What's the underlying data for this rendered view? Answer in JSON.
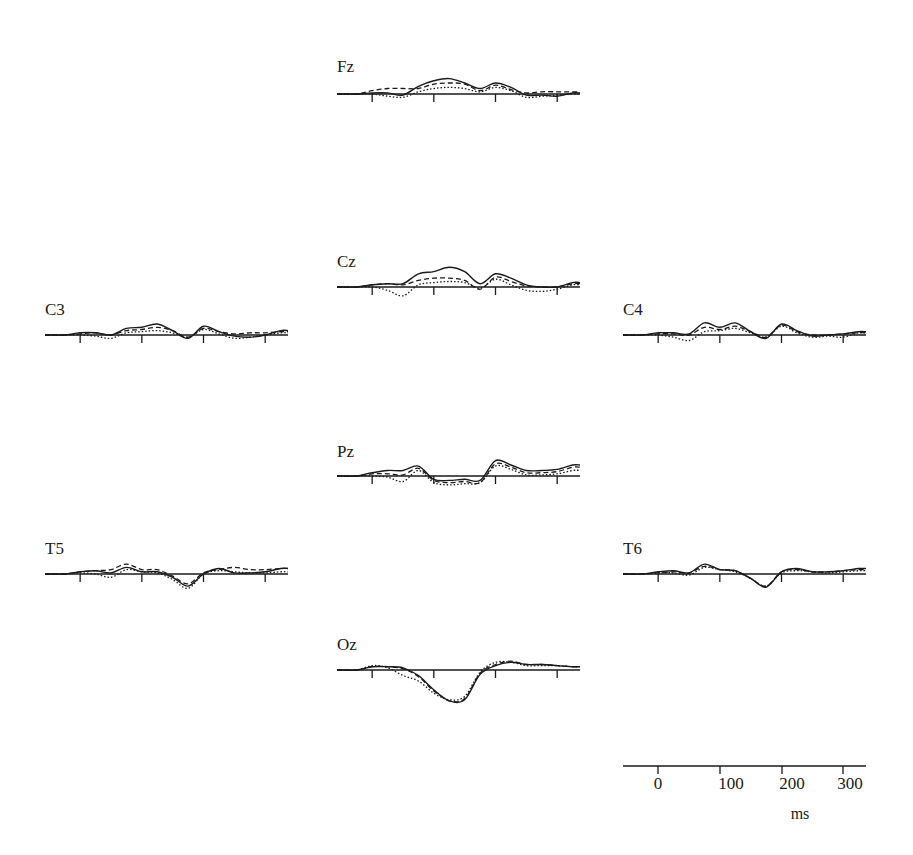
{
  "chart_data": {
    "type": "line",
    "title": "",
    "xlabel": "ms",
    "ylabel": "",
    "xlim": [
      -57,
      337
    ],
    "x_ticks": [
      0,
      100,
      200,
      300
    ],
    "x_tick_labels": [
      "0",
      "100",
      "200",
      "300"
    ],
    "grid": false,
    "legend": null,
    "line_styles": {
      "solid": "condition 1",
      "dashed": "condition 2",
      "dotted": "condition 3"
    },
    "x": [
      -50,
      -25,
      0,
      25,
      50,
      75,
      100,
      125,
      150,
      175,
      200,
      225,
      250,
      275,
      300,
      325
    ],
    "y_units": "relative amplitude (unlabeled)",
    "panels": [
      {
        "electrode": "Fz",
        "series": [
          {
            "name": "solid",
            "values": [
              0,
              0,
              1,
              1,
              -1,
              7,
              12,
              14,
              10,
              5,
              10,
              6,
              -1,
              -1,
              -2,
              1
            ]
          },
          {
            "name": "dashed",
            "values": [
              0,
              0,
              3,
              5,
              5,
              5,
              9,
              10,
              9,
              3,
              8,
              4,
              1,
              2,
              2,
              2
            ]
          },
          {
            "name": "dotted",
            "values": [
              0,
              0,
              0,
              -2,
              -3,
              2,
              5,
              6,
              5,
              2,
              6,
              3,
              -3,
              -2,
              -1,
              0
            ]
          }
        ]
      },
      {
        "electrode": "Cz",
        "series": [
          {
            "name": "solid",
            "values": [
              0,
              0,
              2,
              3,
              3,
              12,
              14,
              18,
              14,
              3,
              12,
              8,
              2,
              0,
              0,
              4
            ]
          },
          {
            "name": "dashed",
            "values": [
              0,
              0,
              2,
              3,
              2,
              6,
              8,
              8,
              6,
              -2,
              9,
              5,
              1,
              0,
              0,
              3
            ]
          },
          {
            "name": "dotted",
            "values": [
              0,
              0,
              0,
              -3,
              -8,
              2,
              4,
              5,
              4,
              -1,
              7,
              2,
              -3,
              -4,
              -2,
              2
            ]
          }
        ]
      },
      {
        "electrode": "C3",
        "series": [
          {
            "name": "solid",
            "values": [
              0,
              0,
              2,
              2,
              0,
              6,
              7,
              10,
              4,
              -3,
              8,
              3,
              -1,
              -2,
              0,
              4
            ]
          },
          {
            "name": "dashed",
            "values": [
              0,
              0,
              1,
              2,
              0,
              4,
              5,
              7,
              4,
              -2,
              6,
              3,
              1,
              2,
              2,
              3
            ]
          },
          {
            "name": "dotted",
            "values": [
              0,
              0,
              0,
              -1,
              -3,
              2,
              3,
              4,
              2,
              -2,
              5,
              1,
              -3,
              -2,
              0,
              2
            ]
          }
        ]
      },
      {
        "electrode": "C4",
        "series": [
          {
            "name": "solid",
            "values": [
              0,
              0,
              2,
              2,
              1,
              11,
              7,
              11,
              3,
              -3,
              10,
              4,
              -1,
              0,
              1,
              3
            ]
          },
          {
            "name": "dashed",
            "values": [
              0,
              0,
              1,
              1,
              0,
              7,
              5,
              8,
              3,
              -2,
              9,
              3,
              0,
              0,
              1,
              2
            ]
          },
          {
            "name": "dotted",
            "values": [
              0,
              0,
              0,
              -2,
              -5,
              3,
              4,
              6,
              2,
              -2,
              8,
              2,
              -2,
              -1,
              -2,
              2
            ]
          }
        ]
      },
      {
        "electrode": "Pz",
        "series": [
          {
            "name": "solid",
            "values": [
              0,
              0,
              3,
              5,
              5,
              9,
              -3,
              -4,
              -3,
              -4,
              14,
              10,
              5,
              5,
              6,
              10
            ]
          },
          {
            "name": "dashed",
            "values": [
              0,
              0,
              2,
              2,
              1,
              7,
              -4,
              -6,
              -5,
              -6,
              11,
              8,
              3,
              3,
              4,
              8
            ]
          },
          {
            "name": "dotted",
            "values": [
              0,
              0,
              0,
              -1,
              -5,
              5,
              -6,
              -8,
              -7,
              -6,
              9,
              6,
              1,
              1,
              2,
              5
            ]
          }
        ]
      },
      {
        "electrode": "T5",
        "series": [
          {
            "name": "solid",
            "values": [
              0,
              0,
              2,
              3,
              1,
              6,
              2,
              2,
              -3,
              -11,
              0,
              5,
              1,
              1,
              2,
              5
            ]
          },
          {
            "name": "dashed",
            "values": [
              0,
              0,
              2,
              3,
              4,
              9,
              4,
              4,
              -2,
              -9,
              1,
              4,
              6,
              4,
              4,
              5
            ]
          },
          {
            "name": "dotted",
            "values": [
              0,
              0,
              1,
              0,
              -3,
              4,
              2,
              1,
              -5,
              -13,
              0,
              3,
              2,
              1,
              1,
              2
            ]
          }
        ]
      },
      {
        "electrode": "T6",
        "series": [
          {
            "name": "solid",
            "values": [
              0,
              0,
              2,
              3,
              1,
              9,
              4,
              3,
              -4,
              -12,
              2,
              5,
              2,
              2,
              3,
              5
            ]
          },
          {
            "name": "dashed",
            "values": [
              0,
              0,
              1,
              2,
              1,
              7,
              4,
              3,
              -4,
              -11,
              2,
              4,
              2,
              2,
              3,
              4
            ]
          },
          {
            "name": "dotted",
            "values": [
              0,
              0,
              1,
              1,
              -1,
              6,
              4,
              2,
              -4,
              -11,
              1,
              3,
              2,
              1,
              2,
              3
            ]
          }
        ]
      },
      {
        "electrode": "Oz",
        "series": [
          {
            "name": "solid",
            "values": [
              0,
              0,
              3,
              3,
              2,
              -5,
              -18,
              -28,
              -27,
              -4,
              4,
              7,
              5,
              5,
              4,
              3
            ]
          },
          {
            "name": "dashed",
            "values": [
              0,
              0,
              3,
              3,
              1,
              -6,
              -19,
              -28,
              -26,
              -3,
              5,
              8,
              5,
              5,
              4,
              3
            ]
          },
          {
            "name": "dotted",
            "values": [
              0,
              0,
              4,
              2,
              -5,
              -10,
              -21,
              -27,
              -24,
              -2,
              7,
              7,
              4,
              4,
              4,
              3
            ]
          }
        ]
      }
    ]
  },
  "electrodes": {
    "Fz": "Fz",
    "Cz": "Cz",
    "C3": "C3",
    "C4": "C4",
    "Pz": "Pz",
    "T5": "T5",
    "T6": "T6",
    "Oz": "Oz"
  },
  "scale_bar": {
    "ticks": [
      "0",
      "100",
      "200",
      "300"
    ],
    "unit": "ms"
  },
  "colors": {
    "ink": "#1a1a1a",
    "background": "#ffffff"
  }
}
